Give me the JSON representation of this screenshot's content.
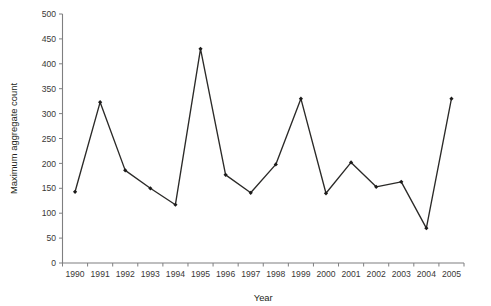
{
  "chart_data": {
    "type": "line",
    "title": "",
    "xlabel": "Year",
    "ylabel": "Maximum aggregate count",
    "categories": [
      "1990",
      "1991",
      "1992",
      "1993",
      "1994",
      "1995",
      "1996",
      "1997",
      "1998",
      "1999",
      "2000",
      "2001",
      "2002",
      "2003",
      "2004",
      "2005"
    ],
    "values": [
      143,
      323,
      186,
      150,
      117,
      430,
      177,
      141,
      198,
      330,
      140,
      202,
      153,
      163,
      70,
      330
    ],
    "series": [
      {
        "name": "Maximum aggregate count",
        "values": [
          143,
          323,
          186,
          150,
          117,
          430,
          177,
          141,
          198,
          330,
          140,
          202,
          153,
          163,
          70,
          330
        ]
      }
    ],
    "ylim": [
      0,
      500
    ],
    "yticks": [
      0,
      50,
      100,
      150,
      200,
      250,
      300,
      350,
      400,
      450,
      500
    ],
    "ytick_labels": [
      "0",
      "50",
      "100",
      "150",
      "200",
      "250",
      "300",
      "350",
      "400",
      "450",
      "500"
    ],
    "xtick_labels": [
      "1990",
      "1991",
      "1992",
      "1993",
      "1994",
      "1995",
      "1996",
      "1997",
      "1998",
      "1999",
      "2000",
      "2001",
      "2002",
      "2003",
      "2004",
      "2005"
    ],
    "grid": false,
    "legend": "none",
    "marker": "filled-diamond",
    "line_color": "#2b2a28",
    "marker_color": "#1c1b1a",
    "axis_color": "#7f7f80",
    "background_color": "#ffffff"
  }
}
